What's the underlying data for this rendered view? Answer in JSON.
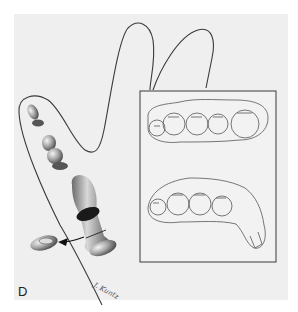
{
  "figure": {
    "panel_label": "D",
    "signature": "J. Kuntz",
    "colors": {
      "background": "#efefef",
      "outline": "#3a3a3a",
      "shading": "#8a8a8a",
      "dark_band": "#1a1a1a"
    },
    "inset": {
      "upper_drawing": "occlusal view of crown row (5 units)",
      "lower_drawing": "side view of crown row with tab extension"
    }
  }
}
